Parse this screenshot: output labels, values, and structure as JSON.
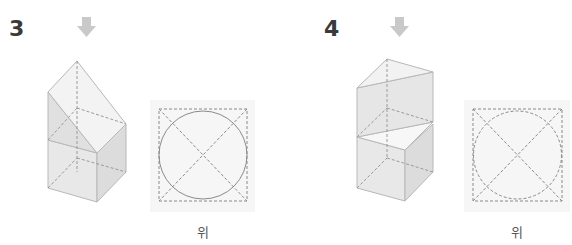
{
  "problems": [
    {
      "number": "3",
      "view_label": "위"
    },
    {
      "number": "4",
      "view_label": "위"
    }
  ],
  "colors": {
    "arrow": "#c9c9c9",
    "face_light": "#f4f4f4",
    "face_mid": "#e6e6e6",
    "face_dark": "#dcdcdc",
    "edge": "#b5b5b5",
    "dash": "#8a8a8a",
    "panel": "#f6f6f6"
  }
}
